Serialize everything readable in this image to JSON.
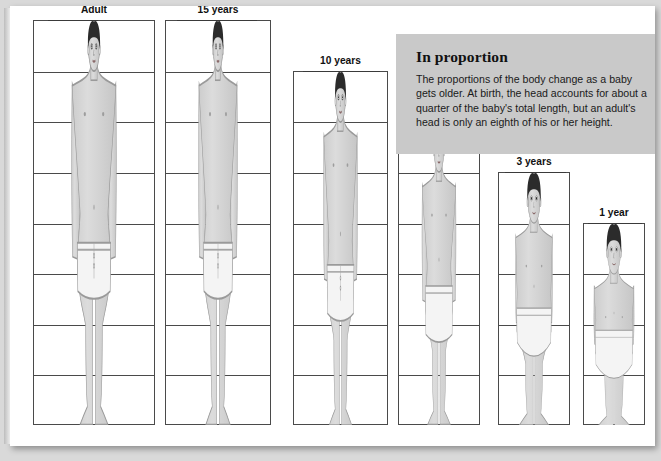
{
  "page": {
    "background_color": "#d9d9d9",
    "sheet_color": "#ffffff"
  },
  "info_box": {
    "title": "In proportion",
    "body": "The proportions of the body change as a baby gets older. At birth, the head accounts for about a quarter of the baby's total length, but an adult's head is only an eighth of his or her height.",
    "background_color": "#c9c9c9"
  },
  "chart_data": {
    "type": "bar",
    "title": "In proportion",
    "xlabel": "",
    "ylabel": "Height in head-lengths",
    "categories": [
      "Adult",
      "15 years",
      "10 years",
      "5 years",
      "3 years",
      "1 year"
    ],
    "values": [
      8,
      8,
      7,
      6,
      5,
      4
    ],
    "ylim": [
      0,
      8
    ],
    "grid": true,
    "legend": "none",
    "annotations": [
      "Head is 1/8 of adult height",
      "Head is 1/4 of a baby's total length"
    ]
  },
  "figures": [
    {
      "label": "Adult",
      "divisions": 8,
      "skin": "#d6d6d6",
      "hair": "#2b2b2b",
      "garment": "#f4f4f4"
    },
    {
      "label": "15 years",
      "divisions": 8,
      "skin": "#d6d6d6",
      "hair": "#2b2b2b",
      "garment": "#f4f4f4"
    },
    {
      "label": "10 years",
      "divisions": 7,
      "skin": "#d6d6d6",
      "hair": "#2b2b2b",
      "garment": "#f4f4f4"
    },
    {
      "label": "5 years",
      "divisions": 6,
      "skin": "#d6d6d6",
      "hair": "#2b2b2b",
      "garment": "#f4f4f4"
    },
    {
      "label": "3 years",
      "divisions": 5,
      "skin": "#d6d6d6",
      "hair": "#2b2b2b",
      "garment": "#f4f4f4"
    },
    {
      "label": "1 year",
      "divisions": 4,
      "skin": "#d6d6d6",
      "hair": "#2b2b2b",
      "garment": "#f4f4f4"
    }
  ]
}
